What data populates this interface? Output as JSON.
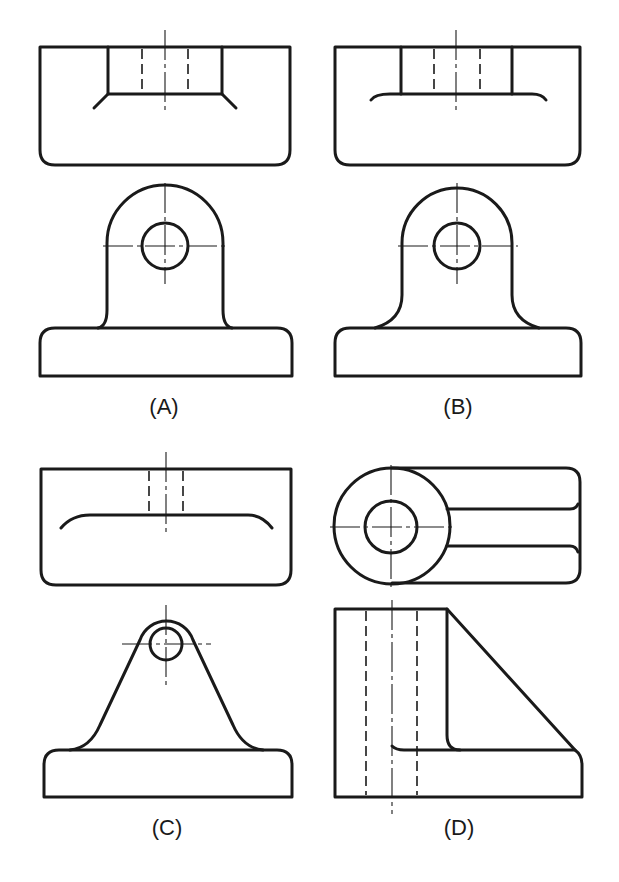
{
  "figure": {
    "options": [
      {
        "id": "A",
        "label": "(A)",
        "top_view": "rectangle with slot and angled chamfer lines",
        "front_view": "rounded lug with hole on base with small fillets"
      },
      {
        "id": "B",
        "label": "(B)",
        "top_view": "rectangle with slot and curved fillet line",
        "front_view": "rounded lug with hole on base with larger fillets"
      },
      {
        "id": "C",
        "label": "(C)",
        "top_view": "rectangle with narrow hidden hole and long curved fillet line",
        "front_view": "tapered lug with small hole on base"
      },
      {
        "id": "D",
        "label": "(D)",
        "top_view": "circular boss with hole joined to rounded rectangle",
        "front_view": "rectangular boss with hidden hole and triangular rib on base"
      }
    ]
  },
  "colors": {
    "line": "#1a1a1a",
    "background": "#ffffff"
  }
}
